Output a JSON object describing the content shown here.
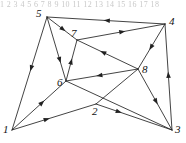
{
  "figure": {
    "top_strip_text": "1 2 3 4 5 6 7 8 9 10 11 12 13 14 15 16 17 18",
    "background_color": "#ffffff",
    "stroke_color": "#222222",
    "label_color": "#111111",
    "width": 186,
    "height": 143
  },
  "chart_data": {
    "type": "diagram",
    "subtype": "directed-graph",
    "title": "",
    "xlabel": "",
    "ylabel": "",
    "grid": false,
    "legend": null,
    "node_count": 8,
    "edge_count": 16,
    "nodes": [
      {
        "id": "1",
        "label": "1",
        "x": 12,
        "y": 130,
        "label_x": 3,
        "label_y": 124
      },
      {
        "id": "2",
        "label": "2",
        "x": 96,
        "y": 104,
        "label_x": 92,
        "label_y": 106
      },
      {
        "id": "3",
        "label": "3",
        "x": 172,
        "y": 130,
        "label_x": 175,
        "label_y": 124
      },
      {
        "id": "4",
        "label": "4",
        "x": 165,
        "y": 24,
        "label_x": 169,
        "label_y": 16
      },
      {
        "id": "5",
        "label": "5",
        "x": 47,
        "y": 17,
        "label_x": 36,
        "label_y": 8
      },
      {
        "id": "6",
        "label": "6",
        "x": 66,
        "y": 81,
        "label_x": 57,
        "label_y": 77
      },
      {
        "id": "7",
        "label": "7",
        "x": 77,
        "y": 40,
        "label_x": 71,
        "label_y": 28
      },
      {
        "id": "8",
        "label": "8",
        "x": 138,
        "y": 69,
        "label_x": 142,
        "label_y": 64
      }
    ],
    "edges": [
      {
        "id": "e-4-5",
        "from": "4",
        "to": "5",
        "arrow_t": 0.52,
        "directed": true
      },
      {
        "id": "e-5-7",
        "from": "5",
        "to": "7",
        "arrow_t": 0.62,
        "directed": true
      },
      {
        "id": "e-5-6",
        "from": "5",
        "to": "6",
        "arrow_t": 0.72,
        "directed": true
      },
      {
        "id": "e-5-1",
        "from": "5",
        "to": "1",
        "arrow_t": 0.48,
        "directed": true
      },
      {
        "id": "e-7-4",
        "from": "7",
        "to": "4",
        "arrow_t": 0.55,
        "directed": true
      },
      {
        "id": "e-8-7",
        "from": "8",
        "to": "7",
        "arrow_t": 0.62,
        "directed": true
      },
      {
        "id": "e-8-6",
        "from": "8",
        "to": "6",
        "arrow_t": 0.58,
        "directed": true
      },
      {
        "id": "e-6-7",
        "from": "6",
        "to": "7",
        "arrow_t": 0.55,
        "directed": true
      },
      {
        "id": "e-4-8",
        "from": "4",
        "to": "8",
        "arrow_t": 0.58,
        "directed": true
      },
      {
        "id": "e-8-3",
        "from": "8",
        "to": "3",
        "arrow_t": 0.58,
        "directed": true
      },
      {
        "id": "e-3-4",
        "from": "3",
        "to": "4",
        "arrow_t": 0.55,
        "directed": true
      },
      {
        "id": "e-1-2",
        "from": "1",
        "to": "2",
        "arrow_t": 0.45,
        "directed": true
      },
      {
        "id": "e-2-3",
        "from": "2",
        "to": "3",
        "arrow_t": 0.34,
        "directed": true
      },
      {
        "id": "e-1-6",
        "from": "1",
        "to": "6",
        "arrow_t": 0.6,
        "directed": true
      },
      {
        "id": "e-6-3",
        "from": "6",
        "to": "3",
        "arrow_t": 0.78,
        "directed": false
      },
      {
        "id": "e-2-8",
        "from": "2",
        "to": "8",
        "arrow_t": 0.7,
        "directed": false
      }
    ]
  }
}
